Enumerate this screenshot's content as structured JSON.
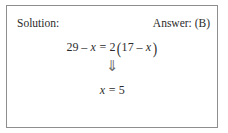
{
  "box": {
    "border_color": "#8e8e8e",
    "background": "#ffffff"
  },
  "header": {
    "solution_label": "Solution:",
    "answer_label": "Answer: (B)"
  },
  "math": {
    "equation": {
      "lhs_number": "29",
      "lhs_operator": "–",
      "lhs_variable": "x",
      "relation": "=",
      "coefficient": "2",
      "open_paren": "(",
      "inner_number": "17",
      "inner_operator": "–",
      "inner_variable": "x",
      "close_paren": ")",
      "plain_text": "29 – x = 2(17 – x)"
    },
    "implication_arrow": "⇓",
    "result": {
      "variable": "x",
      "relation": "=",
      "value": "5",
      "plain_text": "x = 5"
    }
  },
  "colors": {
    "text": "#2b2b2b",
    "arrow": "#6f6f6f",
    "border": "#8e8e8e"
  }
}
